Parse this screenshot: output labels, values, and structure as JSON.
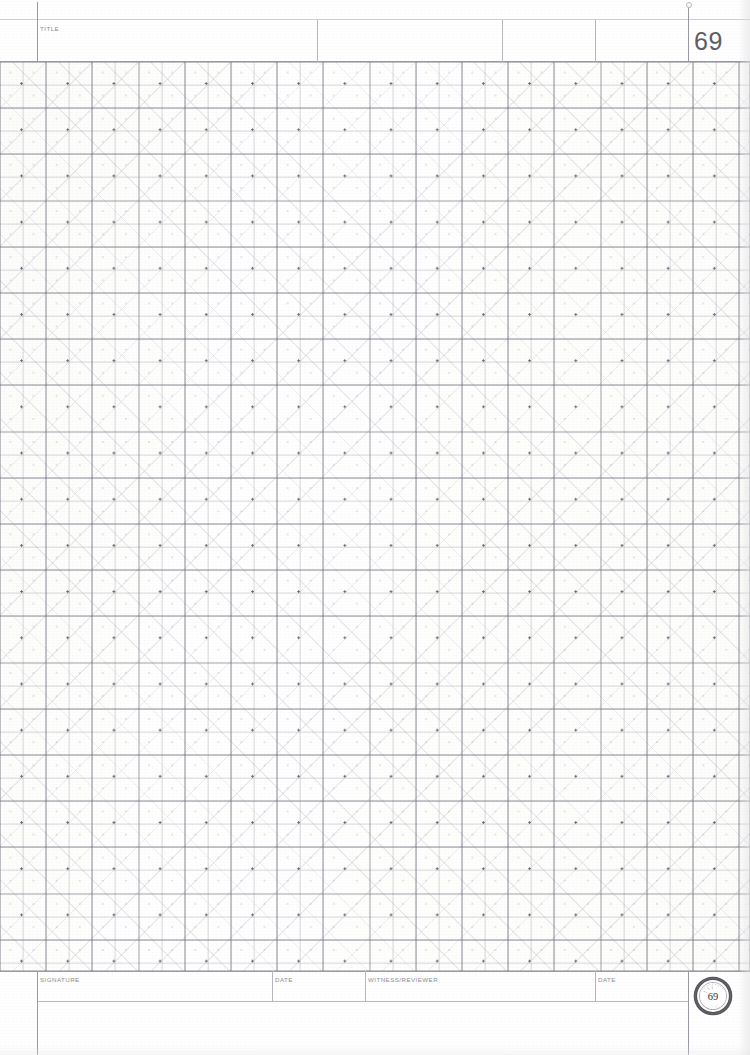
{
  "document": {
    "type": "engineering-lab-notebook-page",
    "page_number": "69",
    "paper": "isometric/quadrille grid"
  },
  "header": {
    "title_label": "TITLE",
    "title_value": "",
    "page_number": "69"
  },
  "footer": {
    "fields": [
      {
        "label": "SIGNATURE",
        "value": ""
      },
      {
        "label": "DATE",
        "value": ""
      },
      {
        "label": "WITNESS/REVIEWER",
        "value": ""
      },
      {
        "label": "DATE",
        "value": ""
      }
    ],
    "seal": {
      "name": "notary-seal-stamp",
      "center_text": "69"
    }
  },
  "grid": {
    "major_spacing_px": "46.2",
    "minor_spacing_px": "23.1",
    "line_color": "#9a9aa2",
    "minor_line_color": "#c4c4cc",
    "dot_color": "#46465 5",
    "diagonal_color": "#9696a5"
  },
  "colors": {
    "paper": "#ffffff",
    "rule": "#b7b7bd",
    "rule_dark": "#9a9aa2",
    "rule_soft": "#cfcfd5",
    "label_text": "#8e8e96",
    "page_number_text": "#5d5d66",
    "seal_ink": "#3c3c42"
  }
}
